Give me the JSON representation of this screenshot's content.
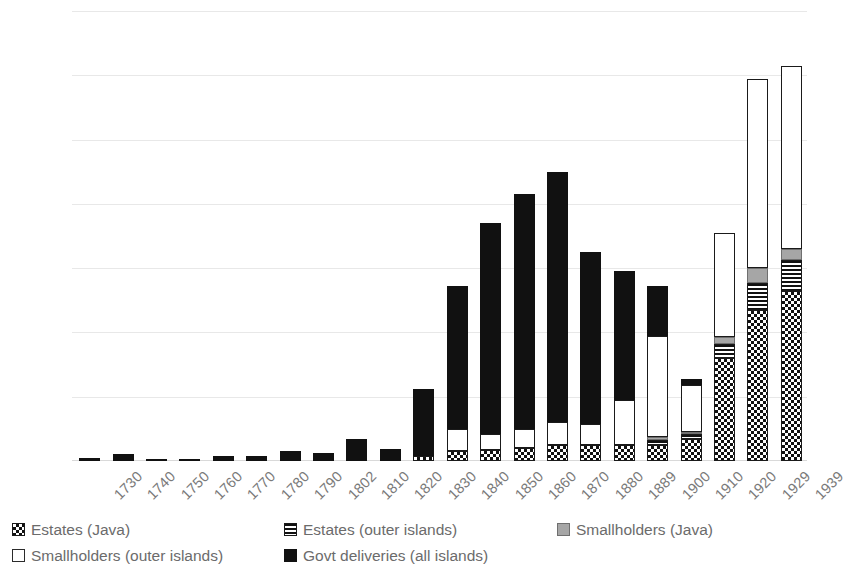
{
  "chart_data": {
    "type": "bar",
    "subtype": "stacked",
    "title": "",
    "subtitle": "",
    "xlabel": "",
    "ylabel": "",
    "ylim": [
      0,
      140000
    ],
    "ytick_step": 20000,
    "yticks": [
      "0",
      "20000",
      "40000",
      "60000",
      "80000",
      "100000",
      "120000",
      "140000"
    ],
    "grid": true,
    "legend_position": "bottom",
    "categories": [
      "1730",
      "1740",
      "1750",
      "1760",
      "1770",
      "1780",
      "1790",
      "1802",
      "1810",
      "1820",
      "1830",
      "1840",
      "1850",
      "1860",
      "1870",
      "1880",
      "1889",
      "1900",
      "1910",
      "1920",
      "1929",
      "1939"
    ],
    "series": [
      {
        "name": "Estates (Java)",
        "pattern": "checkerboard",
        "color": "#111111",
        "values": [
          0,
          0,
          0,
          0,
          0,
          0,
          0,
          0,
          0,
          0,
          1500,
          3000,
          3500,
          4000,
          5000,
          5000,
          5000,
          5000,
          7000,
          32000,
          47000,
          53000
        ]
      },
      {
        "name": "Estates (outer islands)",
        "pattern": "horizontal-stripes",
        "color": "#111111",
        "values": [
          0,
          0,
          0,
          0,
          0,
          0,
          0,
          0,
          0,
          0,
          0,
          0,
          0,
          0,
          0,
          0,
          0,
          1500,
          1500,
          4500,
          8500,
          9500
        ]
      },
      {
        "name": "Smallholders (Java)",
        "pattern": "solid-grey",
        "color": "#a6a6a6",
        "values": [
          0,
          0,
          0,
          0,
          0,
          0,
          0,
          0,
          0,
          0,
          0,
          0,
          0,
          0,
          0,
          0,
          0,
          1000,
          500,
          2000,
          4500,
          3500
        ]
      },
      {
        "name": "Smallholders (outer islands)",
        "pattern": "white-outline",
        "color": "#ffffff",
        "values": [
          0,
          0,
          0,
          0,
          0,
          0,
          0,
          0,
          0,
          0,
          0,
          7000,
          5000,
          6000,
          7000,
          6500,
          14000,
          31500,
          14500,
          32500,
          59000,
          57000
        ]
      },
      {
        "name": "Govt deliveries (all islands)",
        "pattern": "solid-black",
        "color": "#111111",
        "values": [
          800,
          2200,
          700,
          600,
          1500,
          1700,
          3000,
          2400,
          7000,
          3800,
          21000,
          44500,
          65500,
          73000,
          78000,
          53500,
          40000,
          15500,
          2000,
          0,
          0,
          0
        ]
      }
    ],
    "totals": [
      800,
      2200,
      700,
      600,
      1500,
      1700,
      3000,
      2400,
      7000,
      3800,
      22500,
      54500,
      74000,
      83000,
      90000,
      65000,
      59000,
      54500,
      25500,
      71000,
      119000,
      123000
    ]
  },
  "legend": {
    "items": [
      {
        "label": "Estates (Java)",
        "swatch": "estjava"
      },
      {
        "label": "Estates (outer islands)",
        "swatch": "estouter"
      },
      {
        "label": "Smallholders (Java)",
        "swatch": "smalljava"
      },
      {
        "label": "Smallholders (outer islands)",
        "swatch": "smallouter"
      },
      {
        "label": "Govt  deliveries (all islands)",
        "swatch": "govt"
      }
    ]
  },
  "colors": {
    "background": "#ffffff",
    "grid": "#e8e8e8",
    "tick_text": "#595959",
    "xlabel_text": "#7a7a7a",
    "legend_text": "#6b6b6b",
    "dark": "#111111",
    "grey": "#a6a6a6"
  }
}
